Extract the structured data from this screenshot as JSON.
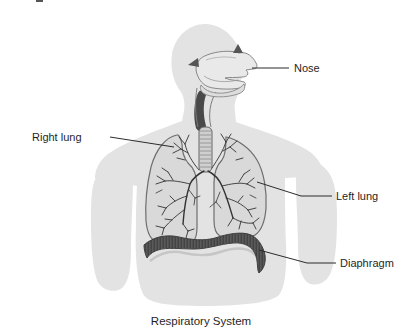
{
  "figure": {
    "caption": "Respiratory System",
    "labels": {
      "nose": "Nose",
      "right_lung": "Right lung",
      "left_lung": "Left lung",
      "diaphragm": "Diaphragm"
    },
    "colors": {
      "background": "#ffffff",
      "body_silhouette": "#e3e3e3",
      "lung_fill": "#d9d9d9",
      "organ_outline": "#6e6e6e",
      "airway_fill": "#e9e9e9",
      "trachea_fill": "#cfcfcf",
      "bronchi_line": "#333333",
      "diaphragm_fill": "#4f4f4f",
      "leader_line": "#2b2b2b",
      "label_text": "#1f1f1f"
    }
  }
}
